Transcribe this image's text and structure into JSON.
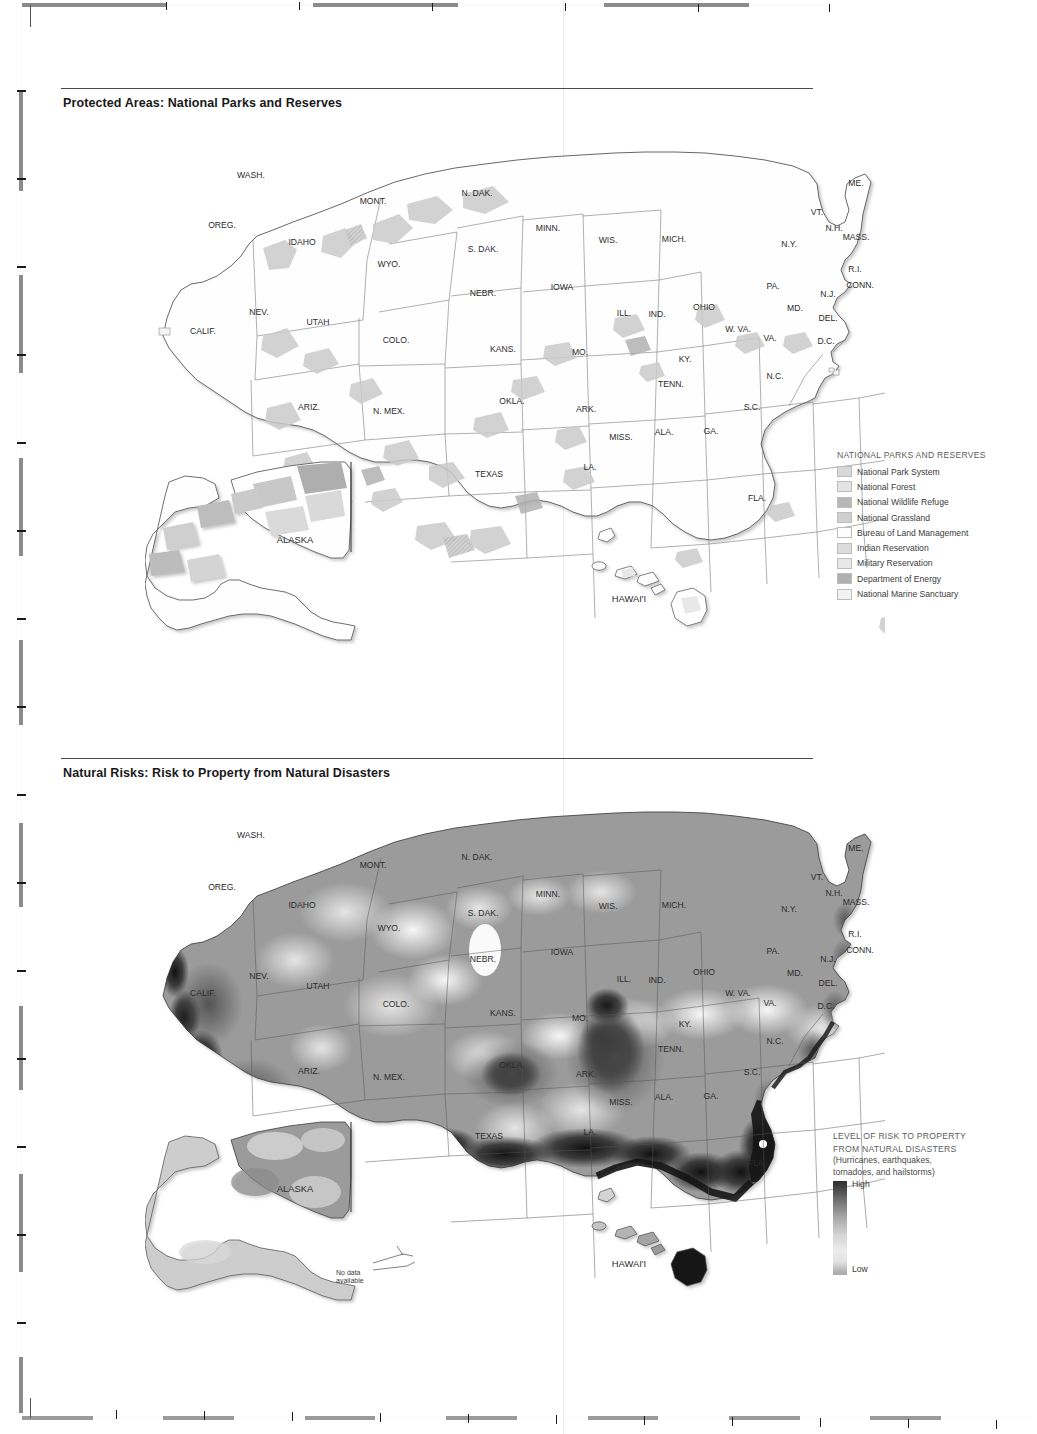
{
  "page": {
    "fold_line_x": 563,
    "background": "#ffffff"
  },
  "sections": [
    {
      "id": "protected-areas",
      "title": "Protected Areas: National Parks and Reserves",
      "rule_width": 752
    },
    {
      "id": "natural-risks",
      "title": "Natural Risks: Risk to Property from Natural Disasters",
      "rule_width": 752
    }
  ],
  "legend_protected": {
    "heading": "NATIONAL PARKS AND RESERVES",
    "items": [
      {
        "label": "National Park System",
        "color": "#d8d8d8"
      },
      {
        "label": "National Forest",
        "color": "#e4e4e4"
      },
      {
        "label": "National Wildlife Refuge",
        "color": "#b7b7b7"
      },
      {
        "label": "National Grassland",
        "color": "#cfcfcf"
      },
      {
        "label": "Bureau of Land Management",
        "color": "#fdfdfd"
      },
      {
        "label": "Indian Reservation",
        "color": "#dcdcdc"
      },
      {
        "label": "Military Reservation",
        "color": "#e8e8e8"
      },
      {
        "label": "Department of Energy",
        "color": "#b0b0b0"
      },
      {
        "label": "National Marine Sanctuary",
        "color": "#f2f2f2"
      }
    ]
  },
  "legend_risk": {
    "heading_line1": "LEVEL OF RISK TO PROPERTY",
    "heading_line2": "FROM NATURAL DISASTERS",
    "sub_line1": "(Hurricanes, earthquakes,",
    "sub_line2": "tornadoes, and hailstorms)",
    "high_label": "High",
    "low_label": "Low",
    "gradient_high": "#2d2d2d",
    "gradient_low": "#ebebeb"
  },
  "annotations": {
    "no_data_line1": "No data",
    "no_data_line2": "available"
  },
  "state_labels": [
    {
      "abbr": "WASH.",
      "x": 251,
      "y": 178
    },
    {
      "abbr": "OREG.",
      "x": 222,
      "y": 228
    },
    {
      "abbr": "IDAHO",
      "x": 302,
      "y": 245
    },
    {
      "abbr": "MONT.",
      "x": 373,
      "y": 204
    },
    {
      "abbr": "WYO.",
      "x": 389,
      "y": 267
    },
    {
      "abbr": "NEV.",
      "x": 259,
      "y": 315
    },
    {
      "abbr": "CALIF.",
      "x": 203,
      "y": 334
    },
    {
      "abbr": "UTAH",
      "x": 318,
      "y": 325
    },
    {
      "abbr": "COLO.",
      "x": 396,
      "y": 343
    },
    {
      "abbr": "ARIZ.",
      "x": 309,
      "y": 410
    },
    {
      "abbr": "N. MEX.",
      "x": 389,
      "y": 414
    },
    {
      "abbr": "N. DAK.",
      "x": 477,
      "y": 196
    },
    {
      "abbr": "S. DAK.",
      "x": 483,
      "y": 252
    },
    {
      "abbr": "NEBR.",
      "x": 483,
      "y": 296
    },
    {
      "abbr": "KANS.",
      "x": 503,
      "y": 352
    },
    {
      "abbr": "OKLA.",
      "x": 512,
      "y": 404
    },
    {
      "abbr": "TEXAS",
      "x": 489,
      "y": 477
    },
    {
      "abbr": "MINN.",
      "x": 548,
      "y": 231
    },
    {
      "abbr": "IOWA",
      "x": 562,
      "y": 290
    },
    {
      "abbr": "MO.",
      "x": 580,
      "y": 355
    },
    {
      "abbr": "ARK.",
      "x": 586,
      "y": 412
    },
    {
      "abbr": "LA.",
      "x": 590,
      "y": 470
    },
    {
      "abbr": "WIS.",
      "x": 608,
      "y": 243
    },
    {
      "abbr": "ILL.",
      "x": 624,
      "y": 316
    },
    {
      "abbr": "MISS.",
      "x": 621,
      "y": 440
    },
    {
      "abbr": "MICH.",
      "x": 674,
      "y": 242
    },
    {
      "abbr": "IND.",
      "x": 657,
      "y": 317
    },
    {
      "abbr": "OHIO",
      "x": 704,
      "y": 310
    },
    {
      "abbr": "KY.",
      "x": 685,
      "y": 362
    },
    {
      "abbr": "TENN.",
      "x": 671,
      "y": 387
    },
    {
      "abbr": "ALA.",
      "x": 664,
      "y": 435
    },
    {
      "abbr": "GA.",
      "x": 711,
      "y": 434
    },
    {
      "abbr": "FLA.",
      "x": 757,
      "y": 501
    },
    {
      "abbr": "S.C.",
      "x": 752,
      "y": 410
    },
    {
      "abbr": "N.C.",
      "x": 775,
      "y": 379
    },
    {
      "abbr": "VA.",
      "x": 770,
      "y": 341
    },
    {
      "abbr": "W. VA.",
      "x": 738,
      "y": 332
    },
    {
      "abbr": "MD.",
      "x": 795,
      "y": 311
    },
    {
      "abbr": "DEL.",
      "x": 828,
      "y": 321
    },
    {
      "abbr": "D.C.",
      "x": 826,
      "y": 344
    },
    {
      "abbr": "PA.",
      "x": 773,
      "y": 289
    },
    {
      "abbr": "N.J.",
      "x": 828,
      "y": 297
    },
    {
      "abbr": "N.Y.",
      "x": 789,
      "y": 247
    },
    {
      "abbr": "CONN.",
      "x": 860,
      "y": 288
    },
    {
      "abbr": "R.I.",
      "x": 855,
      "y": 272
    },
    {
      "abbr": "MASS.",
      "x": 856,
      "y": 240
    },
    {
      "abbr": "N.H.",
      "x": 834,
      "y": 231
    },
    {
      "abbr": "VT.",
      "x": 817,
      "y": 215
    },
    {
      "abbr": "ME.",
      "x": 856,
      "y": 186
    },
    {
      "abbr": "ALASKA",
      "x": 295,
      "y": 543
    },
    {
      "abbr": "HAWAI'I",
      "x": 629,
      "y": 602
    }
  ],
  "state_labels_risk": [
    {
      "abbr": "WASH.",
      "x": 251,
      "y": 838
    },
    {
      "abbr": "OREG.",
      "x": 222,
      "y": 890
    },
    {
      "abbr": "IDAHO",
      "x": 302,
      "y": 908
    },
    {
      "abbr": "MONT.",
      "x": 373,
      "y": 868
    },
    {
      "abbr": "WYO.",
      "x": 389,
      "y": 931
    },
    {
      "abbr": "NEV.",
      "x": 259,
      "y": 979
    },
    {
      "abbr": "CALIF.",
      "x": 203,
      "y": 996
    },
    {
      "abbr": "UTAH",
      "x": 318,
      "y": 989
    },
    {
      "abbr": "COLO.",
      "x": 396,
      "y": 1007
    },
    {
      "abbr": "ARIZ.",
      "x": 309,
      "y": 1074
    },
    {
      "abbr": "N. MEX.",
      "x": 389,
      "y": 1080
    },
    {
      "abbr": "N. DAK.",
      "x": 477,
      "y": 860
    },
    {
      "abbr": "S. DAK.",
      "x": 483,
      "y": 916
    },
    {
      "abbr": "NEBR.",
      "x": 483,
      "y": 962
    },
    {
      "abbr": "KANS.",
      "x": 503,
      "y": 1016
    },
    {
      "abbr": "OKLA.",
      "x": 512,
      "y": 1068
    },
    {
      "abbr": "TEXAS",
      "x": 489,
      "y": 1139
    },
    {
      "abbr": "MINN.",
      "x": 548,
      "y": 897
    },
    {
      "abbr": "IOWA",
      "x": 562,
      "y": 955
    },
    {
      "abbr": "MO.",
      "x": 580,
      "y": 1021
    },
    {
      "abbr": "ARK.",
      "x": 586,
      "y": 1077
    },
    {
      "abbr": "LA.",
      "x": 590,
      "y": 1135
    },
    {
      "abbr": "WIS.",
      "x": 608,
      "y": 909
    },
    {
      "abbr": "ILL.",
      "x": 624,
      "y": 982
    },
    {
      "abbr": "MISS.",
      "x": 621,
      "y": 1105
    },
    {
      "abbr": "MICH.",
      "x": 674,
      "y": 908
    },
    {
      "abbr": "IND.",
      "x": 657,
      "y": 983
    },
    {
      "abbr": "OHIO",
      "x": 704,
      "y": 975
    },
    {
      "abbr": "KY.",
      "x": 685,
      "y": 1027
    },
    {
      "abbr": "TENN.",
      "x": 671,
      "y": 1052
    },
    {
      "abbr": "ALA.",
      "x": 664,
      "y": 1100
    },
    {
      "abbr": "GA.",
      "x": 711,
      "y": 1099
    },
    {
      "abbr": "FLA.",
      "x": 757,
      "y": 1166
    },
    {
      "abbr": "S.C.",
      "x": 752,
      "y": 1075
    },
    {
      "abbr": "N.C.",
      "x": 775,
      "y": 1044
    },
    {
      "abbr": "VA.",
      "x": 770,
      "y": 1006
    },
    {
      "abbr": "W. VA.",
      "x": 738,
      "y": 996
    },
    {
      "abbr": "MD.",
      "x": 795,
      "y": 976
    },
    {
      "abbr": "DEL.",
      "x": 828,
      "y": 986
    },
    {
      "abbr": "D.C.",
      "x": 826,
      "y": 1009
    },
    {
      "abbr": "PA.",
      "x": 773,
      "y": 954
    },
    {
      "abbr": "N.J.",
      "x": 828,
      "y": 962
    },
    {
      "abbr": "N.Y.",
      "x": 789,
      "y": 912
    },
    {
      "abbr": "CONN.",
      "x": 860,
      "y": 953
    },
    {
      "abbr": "R.I.",
      "x": 855,
      "y": 937
    },
    {
      "abbr": "MASS.",
      "x": 856,
      "y": 905
    },
    {
      "abbr": "N.H.",
      "x": 834,
      "y": 896
    },
    {
      "abbr": "VT.",
      "x": 817,
      "y": 880
    },
    {
      "abbr": "ME.",
      "x": 856,
      "y": 851
    },
    {
      "abbr": "ALASKA",
      "x": 295,
      "y": 1192
    },
    {
      "abbr": "HAWAI'I",
      "x": 629,
      "y": 1267
    }
  ],
  "chart_data": {
    "type": "map",
    "maps": [
      {
        "title": "Protected Areas: National Parks and Reserves",
        "region": "United States including Alaska and Hawai'i",
        "encoding": "categorical fill by federal land designation",
        "categories": [
          "National Park System",
          "National Forest",
          "National Wildlife Refuge",
          "National Grassland",
          "Bureau of Land Management",
          "Indian Reservation",
          "Military Reservation",
          "Department of Energy",
          "National Marine Sanctuary"
        ]
      },
      {
        "title": "Natural Risks: Risk to Property from Natural Disasters",
        "region": "United States including Alaska and Hawai'i",
        "encoding": "continuous grayscale choropleth, dark = High risk, light = Low risk",
        "hazards": [
          "Hurricanes",
          "earthquakes",
          "tornadoes",
          "hailstorms"
        ],
        "scale_endpoints": [
          "High",
          "Low"
        ],
        "notes": [
          "No data available for the Aleutian Islands portion of Alaska"
        ],
        "high_risk_zones": [
          "Coastal California (San Andreas / earthquake)",
          "Gulf Coast from Texas to Florida (hurricanes)",
          "South Florida (hurricanes)",
          "New Madrid zone: Arkansas / Missouri / Tennessee (earthquakes)",
          "Central Oklahoma (tornadoes and hailstorms)",
          "Atlantic coast of the Carolinas (hurricanes)",
          "Island of Hawai'i (volcanic / earthquake)"
        ]
      }
    ]
  }
}
